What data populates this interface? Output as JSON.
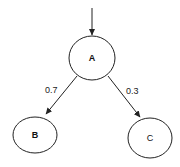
{
  "diagram": {
    "type": "probability-tree",
    "nodes": [
      {
        "id": "A",
        "label": "A",
        "cx": 92,
        "cy": 58,
        "rx": 23,
        "ry": 22
      },
      {
        "id": "B",
        "label": "B",
        "cx": 35,
        "cy": 135,
        "rx": 22,
        "ry": 18
      },
      {
        "id": "C",
        "label": "C",
        "cx": 150,
        "cy": 138,
        "rx": 22,
        "ry": 20
      }
    ],
    "edges": [
      {
        "from": "start",
        "to": "A",
        "label": ""
      },
      {
        "from": "A",
        "to": "B",
        "label": "0.7"
      },
      {
        "from": "A",
        "to": "C",
        "label": "0.3"
      }
    ],
    "colors": {
      "stroke": "#222222",
      "background": "#ffffff"
    }
  }
}
